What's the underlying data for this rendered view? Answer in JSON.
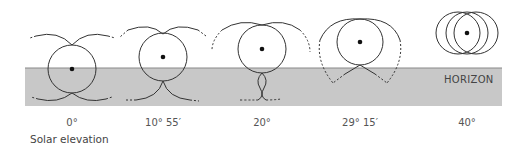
{
  "diagram": {
    "horizon_label": "HORIZON",
    "caption": "Solar elevation",
    "colors": {
      "ground": "#c8c8c8",
      "horizon_line": "#888888",
      "stroke": "#333333",
      "sun_dot": "#111111"
    },
    "stages": [
      {
        "label": "0°"
      },
      {
        "label": "10° 55′"
      },
      {
        "label": "20°"
      },
      {
        "label": "29° 15′"
      },
      {
        "label": "40°"
      }
    ]
  }
}
